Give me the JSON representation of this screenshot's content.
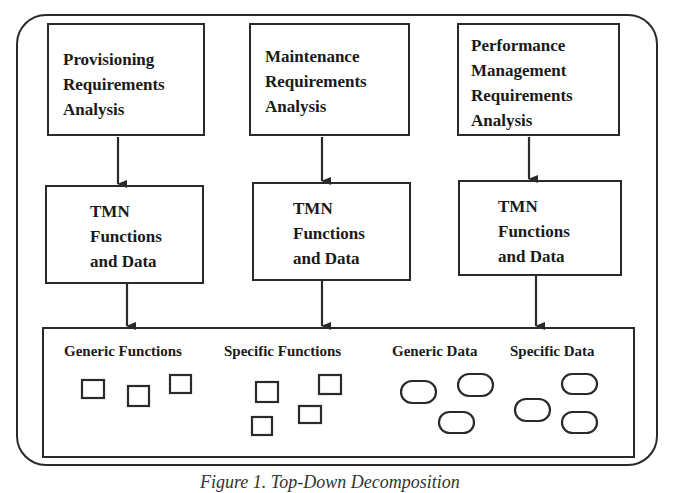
{
  "diagram": {
    "top_boxes": [
      {
        "lines": [
          "Provisioning",
          "Requirements",
          "Analysis"
        ]
      },
      {
        "lines": [
          "Maintenance",
          "Requirements",
          "Analysis"
        ]
      },
      {
        "lines": [
          "Performance",
          "Management",
          "Requirements",
          "Analysis"
        ]
      }
    ],
    "middle_boxes": [
      {
        "lines": [
          "TMN",
          "Functions",
          "and Data"
        ]
      },
      {
        "lines": [
          "TMN",
          "Functions",
          "and Data"
        ]
      },
      {
        "lines": [
          "TMN",
          "Functions",
          "and Data"
        ]
      }
    ],
    "bottom_box": {
      "groups": [
        {
          "label": "Generic Functions",
          "shape": "square",
          "count": 3
        },
        {
          "label": "Specific Functions",
          "shape": "square",
          "count": 4
        },
        {
          "label": "Generic Data",
          "shape": "rounded-oval",
          "count": 3
        },
        {
          "label": "Specific Data",
          "shape": "rounded-oval",
          "count": 3
        }
      ]
    },
    "caption": "Figure 1. Top-Down Decomposition",
    "colors": {
      "line": "#2a2a2a",
      "background": "#ffffff"
    }
  }
}
